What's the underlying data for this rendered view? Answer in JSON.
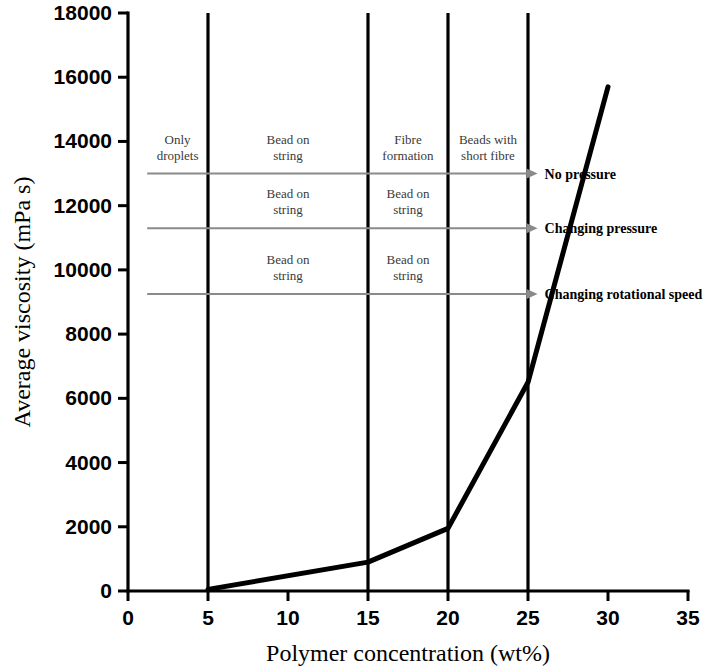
{
  "chart_data": {
    "type": "line",
    "title": "",
    "xlabel": "Polymer concentration (wt%)",
    "ylabel": "Average viscosity (mPa s)",
    "xlim": [
      0,
      35
    ],
    "ylim": [
      0,
      18000
    ],
    "xticks": [
      0,
      5,
      10,
      15,
      20,
      25,
      30,
      35
    ],
    "yticks": [
      0,
      2000,
      4000,
      6000,
      8000,
      10000,
      12000,
      14000,
      16000,
      18000
    ],
    "xtick_labels": [
      "0",
      "5",
      "10",
      "15",
      "20",
      "25",
      "30",
      "35"
    ],
    "ytick_labels": [
      "0",
      "2000",
      "4000",
      "6000",
      "8000",
      "10000",
      "12000",
      "14000",
      "16000",
      "18000"
    ],
    "grid": false,
    "legend": "none",
    "series": [
      {
        "name": "Average viscosity",
        "x": [
          5,
          15,
          20,
          25,
          30
        ],
        "values": [
          50,
          900,
          1950,
          6500,
          15700
        ]
      }
    ],
    "vertical_dividers": [
      5,
      15,
      20,
      25
    ],
    "annotation_rows": [
      {
        "row_label": "No pressure",
        "y_value": 13000,
        "arrow_from_x": 1.2,
        "arrow_to_x": 25.6,
        "regions": [
          {
            "label": "Only droplets",
            "x_center": 3.1
          },
          {
            "label": "Bead on string",
            "x_center": 10.0
          },
          {
            "label": "Fibre formation",
            "x_center": 17.5
          },
          {
            "label": "Beads with short fibre",
            "x_center": 22.5
          }
        ]
      },
      {
        "row_label": "Changing pressure",
        "y_value": 11300,
        "arrow_from_x": 1.2,
        "arrow_to_x": 25.6,
        "regions": [
          {
            "label": "Bead on string",
            "x_center": 10.0
          },
          {
            "label": "Bead on string",
            "x_center": 17.5
          }
        ]
      },
      {
        "row_label": "Changing rotational speed",
        "y_value": 9250,
        "arrow_from_x": 1.2,
        "arrow_to_x": 25.6,
        "regions": [
          {
            "label": "Bead on string",
            "x_center": 10.0
          },
          {
            "label": "Bead on string",
            "x_center": 17.5
          }
        ]
      }
    ]
  },
  "colors": {
    "curve": "#000000",
    "axis": "#000000",
    "divider": "#000000",
    "arrow": "#8a8a8a",
    "region_text": "#3a3a3a",
    "row_text": "#000000",
    "background": "#ffffff"
  }
}
